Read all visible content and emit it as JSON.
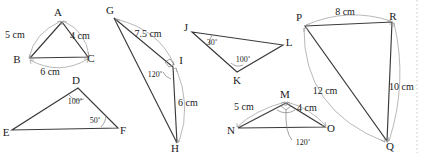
{
  "figure": {
    "background": "#ffffff",
    "line_color": "#3a3a3a",
    "dimension_color": "#9a9a9a",
    "text_color": "#1a1a1a"
  },
  "triangles": [
    {
      "id": "ABC",
      "vertices": [
        {
          "name": "A",
          "label": "A",
          "x": 62,
          "y": 22
        },
        {
          "name": "B",
          "label": "B",
          "x": 30,
          "y": 58
        },
        {
          "name": "C",
          "label": "C",
          "x": 88,
          "y": 57
        }
      ],
      "vertex_label_pos": [
        {
          "label": "A",
          "x": 58,
          "y": 16
        },
        {
          "label": "B",
          "x": 17,
          "y": 63
        },
        {
          "label": "C",
          "x": 91,
          "y": 62
        }
      ],
      "sides": [
        {
          "from": "B",
          "to": "A",
          "length": "5 cm",
          "label_x": 9,
          "label_y": 38
        },
        {
          "from": "A",
          "to": "C",
          "length": "4 cm",
          "label_x": 74,
          "label_y": 39
        },
        {
          "from": "B",
          "to": "C",
          "length": "6 cm",
          "label_x": 42,
          "label_y": 73
        }
      ],
      "angles": []
    },
    {
      "id": "DEF",
      "vertices": [
        {
          "name": "D",
          "label": "D",
          "x": 78,
          "y": 88
        },
        {
          "name": "E",
          "label": "E",
          "x": 12,
          "y": 130
        },
        {
          "name": "F",
          "label": "F",
          "x": 118,
          "y": 128
        }
      ],
      "vertex_label_pos": [
        {
          "label": "D",
          "x": 74,
          "y": 84
        },
        {
          "label": "E",
          "x": 2,
          "y": 135
        },
        {
          "label": "F",
          "x": 120,
          "y": 134
        }
      ],
      "sides": [],
      "angles": [
        {
          "at": "D",
          "value": "100˚",
          "label_x": 67,
          "label_y": 101
        },
        {
          "at": "F",
          "value": "50˚",
          "label_x": 90,
          "label_y": 123
        }
      ]
    },
    {
      "id": "GIH",
      "vertices": [
        {
          "name": "G",
          "label": "G",
          "x": 114,
          "y": 18
        },
        {
          "name": "I",
          "label": "I",
          "x": 173,
          "y": 67
        },
        {
          "name": "H",
          "label": "H",
          "x": 177,
          "y": 143
        }
      ],
      "vertex_label_pos": [
        {
          "label": "G",
          "x": 108,
          "y": 13
        },
        {
          "label": "I",
          "x": 178,
          "y": 64
        },
        {
          "label": "H",
          "x": 172,
          "y": 151
        }
      ],
      "sides": [
        {
          "from": "G",
          "to": "I",
          "length": "7.5 cm",
          "label_x": 140,
          "label_y": 36
        },
        {
          "from": "I",
          "to": "H",
          "length": "6 cm",
          "label_x": 180,
          "label_y": 105
        }
      ],
      "angles": [
        {
          "at": "I",
          "value": "120˚",
          "label_x": 151,
          "label_y": 76
        }
      ]
    },
    {
      "id": "JKL",
      "vertices": [
        {
          "name": "J",
          "label": "J",
          "x": 192,
          "y": 32
        },
        {
          "name": "L",
          "label": "L",
          "x": 283,
          "y": 45
        },
        {
          "name": "K",
          "label": "K",
          "x": 237,
          "y": 72
        }
      ],
      "vertex_label_pos": [
        {
          "label": "J",
          "x": 184,
          "y": 30
        },
        {
          "label": "L",
          "x": 286,
          "y": 45
        },
        {
          "label": "K",
          "x": 234,
          "y": 84
        }
      ],
      "sides": [],
      "angles": [
        {
          "at": "J",
          "value": "30˚",
          "label_x": 206,
          "label_y": 44
        },
        {
          "at": "K",
          "value": "100˚",
          "label_x": 238,
          "label_y": 63
        }
      ]
    },
    {
      "id": "MNO",
      "vertices": [
        {
          "name": "M",
          "label": "M",
          "x": 286,
          "y": 103
        },
        {
          "name": "N",
          "label": "N",
          "x": 238,
          "y": 128
        },
        {
          "name": "O",
          "label": "O",
          "x": 325,
          "y": 127
        }
      ],
      "vertex_label_pos": [
        {
          "label": "M",
          "x": 282,
          "y": 98
        },
        {
          "label": "N",
          "x": 228,
          "y": 134
        },
        {
          "label": "O",
          "x": 328,
          "y": 132
        }
      ],
      "sides": [
        {
          "from": "N",
          "to": "M",
          "length": "5 cm",
          "label_x": 236,
          "label_y": 109
        },
        {
          "from": "M",
          "to": "O",
          "length": "4 cm",
          "label_x": 300,
          "label_y": 110
        }
      ],
      "angles": [
        {
          "at": "M",
          "value": "120˚",
          "label_x": 289,
          "label_y": 143
        }
      ]
    },
    {
      "id": "PRQ",
      "vertices": [
        {
          "name": "P",
          "label": "P",
          "x": 305,
          "y": 26
        },
        {
          "name": "R",
          "label": "R",
          "x": 392,
          "y": 22
        },
        {
          "name": "Q",
          "label": "Q",
          "x": 387,
          "y": 141
        }
      ],
      "vertex_label_pos": [
        {
          "label": "P",
          "x": 297,
          "y": 21
        },
        {
          "label": "R",
          "x": 391,
          "y": 20
        },
        {
          "label": "Q",
          "x": 388,
          "y": 149
        }
      ],
      "sides": [
        {
          "from": "P",
          "to": "R",
          "length": "8 cm",
          "label_x": 337,
          "label_y": 14
        },
        {
          "from": "R",
          "to": "Q",
          "length": "10 cm",
          "label_x": 392,
          "label_y": 88
        },
        {
          "from": "P",
          "to": "Q",
          "length": "12 cm",
          "label_x": 315,
          "label_y": 92
        }
      ],
      "angles": []
    }
  ]
}
